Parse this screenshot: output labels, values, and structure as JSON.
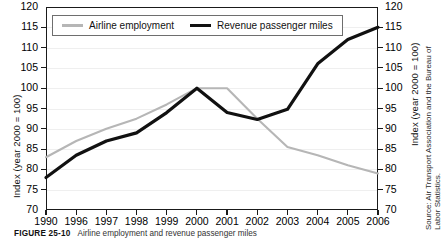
{
  "chart_data": {
    "type": "line",
    "title": "",
    "xlabel": "",
    "ylabel": "Index (year 2000 = 100)",
    "ylabel_right": "Index (year 2000 = 100)",
    "ylim": [
      70,
      120
    ],
    "ytick_values": [
      120,
      115,
      110,
      105,
      100,
      95,
      90,
      85,
      80,
      75,
      70
    ],
    "ytick_labels": [
      "120",
      "115",
      "110",
      "105",
      "100",
      "95",
      "90",
      "85",
      "80",
      "75",
      "70"
    ],
    "categories": [
      "1990",
      "1996",
      "1997",
      "1998",
      "1999",
      "2000",
      "2001",
      "2002",
      "2003",
      "2004",
      "2005",
      "2006"
    ],
    "grid": true,
    "legend_position": "top-left-inside",
    "series": [
      {
        "name": "Airline employment",
        "color": "#b6b6b6",
        "width": 2.1,
        "values": [
          83.0,
          87.0,
          90.0,
          92.5,
          96.0,
          100.0,
          100.0,
          92.5,
          85.5,
          83.5,
          81.0,
          79.0
        ]
      },
      {
        "name": "Revenue passenger miles",
        "color": "#111111",
        "width": 3.2,
        "values": [
          78.0,
          83.5,
          87.0,
          89.0,
          94.0,
          100.0,
          94.0,
          92.3,
          94.8,
          106.0,
          112.0,
          115.0
        ]
      }
    ]
  },
  "legend": {
    "items": [
      {
        "label": "Airline employment",
        "style": "gray"
      },
      {
        "label": "Revenue passenger miles",
        "style": "black"
      }
    ]
  },
  "source": {
    "line1": "Source: Air Transport Association and the Bureau of",
    "line2": "Labor Statistics."
  },
  "caption": {
    "figure_number": "FIGURE 25-10",
    "text": "Airline employment and revenue passenger miles"
  }
}
